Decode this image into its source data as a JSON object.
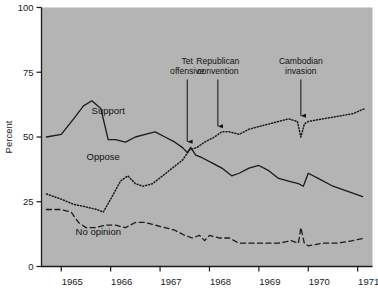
{
  "chart_data": {
    "type": "line",
    "title": "",
    "subtitle": "",
    "xlabel": "",
    "ylabel": "Percent",
    "xlim": [
      1964.6,
      1971.3
    ],
    "ylim": [
      0,
      100
    ],
    "ytick_labels": [
      "0",
      "25",
      "50",
      "75",
      "100"
    ],
    "ytick_values": [
      0,
      25,
      50,
      75,
      100
    ],
    "xtick_labels": [
      "1965",
      "1966",
      "1967",
      "1968",
      "1969",
      "1970",
      "1971"
    ],
    "xtick_values": [
      1965,
      1966,
      1967,
      1968,
      1969,
      1970,
      1971
    ],
    "grid": false,
    "legend_position": "inline-labels",
    "plot_background": "#b4b4b4",
    "line_color": "#1a1a1a",
    "series": [
      {
        "name": "Support",
        "style": "solid",
        "label_x": 1965.95,
        "label_y": 59,
        "x": [
          1964.7,
          1965.0,
          1965.25,
          1965.45,
          1965.62,
          1965.8,
          1965.95,
          1966.1,
          1966.3,
          1966.5,
          1966.7,
          1966.9,
          1967.1,
          1967.3,
          1967.45,
          1967.55,
          1967.62,
          1967.72,
          1967.85,
          1968.05,
          1968.25,
          1968.45,
          1968.6,
          1968.8,
          1969.0,
          1969.2,
          1969.4,
          1969.6,
          1969.8,
          1969.9,
          1970.0,
          1970.2,
          1970.5,
          1970.8,
          1971.1
        ],
        "y": [
          50,
          51,
          57,
          62,
          64,
          61,
          49,
          49,
          48,
          50,
          51,
          52,
          50,
          48,
          46,
          44,
          46,
          43,
          42,
          40,
          38,
          35,
          36,
          38,
          39,
          37,
          34,
          33,
          32,
          31,
          36,
          34,
          31,
          29,
          27
        ]
      },
      {
        "name": "Oppose",
        "style": "dotted",
        "label_x": 1965.85,
        "label_y": 41,
        "x": [
          1964.7,
          1965.0,
          1965.25,
          1965.5,
          1965.72,
          1965.85,
          1966.0,
          1966.2,
          1966.35,
          1966.5,
          1966.65,
          1966.85,
          1967.05,
          1967.25,
          1967.45,
          1967.6,
          1967.75,
          1967.9,
          1968.1,
          1968.25,
          1968.4,
          1968.6,
          1968.8,
          1969.0,
          1969.2,
          1969.4,
          1969.6,
          1969.78,
          1969.85,
          1969.92,
          1970.0,
          1970.3,
          1970.6,
          1970.9,
          1971.15
        ],
        "y": [
          28,
          26,
          24,
          23,
          22,
          21,
          26,
          33,
          35,
          32,
          31,
          32,
          35,
          38,
          41,
          45,
          46,
          48,
          50,
          52,
          52,
          51,
          53,
          54,
          55,
          56,
          57,
          56,
          50,
          55,
          56,
          57,
          58,
          59,
          61
        ]
      },
      {
        "name": "No opinion",
        "style": "dashed",
        "label_x": 1965.75,
        "label_y": 12,
        "x": [
          1964.7,
          1965.0,
          1965.2,
          1965.35,
          1965.5,
          1965.7,
          1965.9,
          1966.1,
          1966.3,
          1966.5,
          1966.7,
          1966.9,
          1967.1,
          1967.3,
          1967.5,
          1967.65,
          1967.8,
          1967.9,
          1968.0,
          1968.2,
          1968.4,
          1968.6,
          1968.8,
          1969.1,
          1969.4,
          1969.65,
          1969.8,
          1969.85,
          1969.92,
          1970.0,
          1970.3,
          1970.6,
          1970.9,
          1971.15
        ],
        "y": [
          22,
          22,
          21,
          17,
          15,
          15,
          16,
          16,
          15,
          17,
          17,
          16,
          15,
          14,
          12,
          11,
          12,
          10,
          12,
          11,
          11,
          9,
          9,
          9,
          9,
          10,
          9,
          15,
          9,
          8,
          9,
          9,
          10,
          11
        ]
      }
    ],
    "annotations": [
      {
        "label_line1": "Tet",
        "label_line2": "offensive",
        "x": 1967.55,
        "text_x": 1967.55,
        "text_y": 78,
        "arrow_to_y": 47
      },
      {
        "label_line1": "Republican",
        "label_line2": "convention",
        "x": 1968.17,
        "text_x": 1968.17,
        "text_y": 78,
        "arrow_to_y": 53
      },
      {
        "label_line1": "Cambodian",
        "label_line2": "invasion",
        "x": 1969.85,
        "text_x": 1969.85,
        "text_y": 78,
        "arrow_to_y": 57
      }
    ]
  }
}
